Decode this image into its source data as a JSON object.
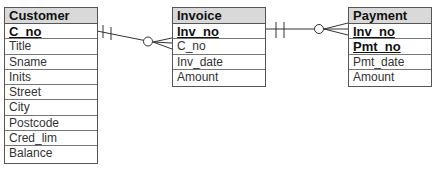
{
  "diagram": {
    "type": "entity-relationship",
    "entities": [
      {
        "name": "Customer",
        "attributes": [
          {
            "label": "C_no",
            "primary_key": true
          },
          {
            "label": "Title",
            "primary_key": false
          },
          {
            "label": "Sname",
            "primary_key": false
          },
          {
            "label": "Inits",
            "primary_key": false
          },
          {
            "label": "Street",
            "primary_key": false
          },
          {
            "label": "City",
            "primary_key": false
          },
          {
            "label": "Postcode",
            "primary_key": false
          },
          {
            "label": "Cred_lim",
            "primary_key": false
          },
          {
            "label": "Balance",
            "primary_key": false
          }
        ]
      },
      {
        "name": "Invoice",
        "attributes": [
          {
            "label": "Inv_no",
            "primary_key": true
          },
          {
            "label": "C_no",
            "primary_key": false
          },
          {
            "label": "Inv_date",
            "primary_key": false
          },
          {
            "label": "Amount",
            "primary_key": false
          }
        ]
      },
      {
        "name": "Payment",
        "attributes": [
          {
            "label": "Inv_no",
            "primary_key": true
          },
          {
            "label": "Pmt_no",
            "primary_key": true
          },
          {
            "label": "Pmt_date",
            "primary_key": false
          },
          {
            "label": "Amount",
            "primary_key": false
          }
        ]
      }
    ],
    "relationships": [
      {
        "from": "Customer",
        "to": "Invoice",
        "from_cardinality": "exactly-one",
        "to_cardinality": "zero-or-many"
      },
      {
        "from": "Invoice",
        "to": "Payment",
        "from_cardinality": "exactly-one",
        "to_cardinality": "zero-or-many"
      }
    ],
    "colors": {
      "header_fill": "#d9d9d9",
      "border": "#555555",
      "line": "#333333"
    }
  }
}
